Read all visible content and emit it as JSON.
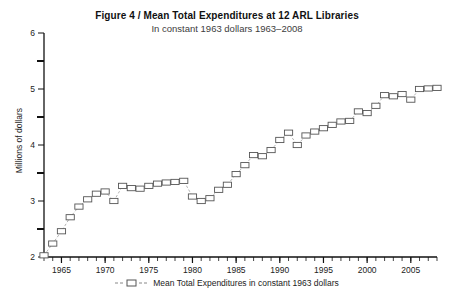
{
  "figure": {
    "title_main": "Figure 4  /  Mean Total Expenditures at 12 ARL Libraries",
    "title_sub": "In constant 1963 dollars 1963–2008",
    "ylabel": "Millions of dollars",
    "legend_label": "Mean Total Expenditures in constant 1963 dollars"
  },
  "chart_data": {
    "type": "line",
    "title": "Figure 4  /  Mean Total Expenditures at 12 ARL Libraries",
    "subtitle": "In constant 1963 dollars 1963–2008",
    "xlabel": "",
    "ylabel": "Millions of dollars",
    "xlim": [
      1963,
      2008
    ],
    "ylim": [
      2,
      6
    ],
    "xticks": [
      1965,
      1970,
      1975,
      1980,
      1985,
      1990,
      1995,
      2000,
      2005
    ],
    "xtick_labels": [
      "1965",
      "1970",
      "1975",
      "1980",
      "1985",
      "1990",
      "1995",
      "2000",
      "2005"
    ],
    "yticks": [
      2,
      3,
      4,
      5,
      6
    ],
    "ytick_labels": [
      "2",
      "3",
      "4",
      "5",
      "6"
    ],
    "yminorticks": [
      2.5,
      3.5,
      4.5,
      5.5
    ],
    "xminortick_interval": 1,
    "grid": false,
    "legend_position": "below-axes",
    "marker": "open-square",
    "linestyle": "dashed",
    "series": [
      {
        "name": "Mean Total Expenditures in constant 1963 dollars",
        "color": "#555555",
        "x": [
          1963,
          1964,
          1965,
          1966,
          1967,
          1968,
          1969,
          1970,
          1971,
          1972,
          1973,
          1974,
          1975,
          1976,
          1977,
          1978,
          1979,
          1980,
          1981,
          1982,
          1983,
          1984,
          1985,
          1986,
          1987,
          1988,
          1989,
          1990,
          1991,
          1992,
          1993,
          1994,
          1995,
          1996,
          1997,
          1998,
          1999,
          2000,
          2001,
          2002,
          2003,
          2004,
          2005,
          2006,
          2007,
          2008
        ],
        "values": [
          2.03,
          2.24,
          2.46,
          2.71,
          2.9,
          3.03,
          3.13,
          3.17,
          3.0,
          3.27,
          3.23,
          3.22,
          3.27,
          3.31,
          3.33,
          3.34,
          3.36,
          3.08,
          3.0,
          3.05,
          3.2,
          3.29,
          3.48,
          3.64,
          3.82,
          3.8,
          3.91,
          4.09,
          4.22,
          4.0,
          4.17,
          4.24,
          4.3,
          4.36,
          4.42,
          4.43,
          4.6,
          4.57,
          4.7,
          4.89,
          4.87,
          4.91,
          4.81,
          5.0,
          5.01,
          5.02
        ]
      }
    ]
  },
  "colors": {
    "axis": "#111111",
    "marker_edge": "#555555",
    "line": "#aaaaaa",
    "text": "#222222"
  }
}
